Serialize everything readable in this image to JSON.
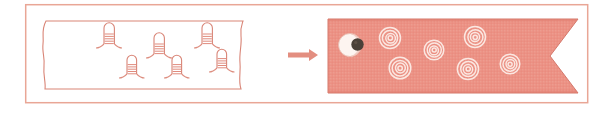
{
  "figure": {
    "title": "Hairpin-studded sheet transforms into ringed ribbon",
    "caption": "",
    "width": 615,
    "height": 113,
    "background_color": "#ffffff"
  },
  "colors": {
    "outline": "#d98577",
    "outline_light": "#e7a496",
    "ribbon_fill": "#ec9184",
    "ribbon_edge": "#d4786b",
    "ribbon_texture": "#e8ad9f",
    "ring_stroke": "#fbe7e1",
    "eye_white": "#fdf4f0",
    "eye_pupil": "#4a4038",
    "eye_iris": "#6b5a4e",
    "arrow": "#e38e80",
    "panel_fill": "#ffffff",
    "border": "#e9a696"
  },
  "outer_border": {
    "label": "figure-frame",
    "x": 25,
    "y": 4,
    "width": 563,
    "height": 99,
    "stroke_width": 1.4
  },
  "left_panel": {
    "label": "membrane-sheet",
    "description": "torn-edge sheet with hairpin stem-loops",
    "x": 42,
    "y": 20,
    "width": 200,
    "height": 70,
    "hairpins": [
      {
        "id": "hairpin-1",
        "row": "top",
        "cx": 108,
        "base_y": 22,
        "height": 22,
        "rungs": 5
      },
      {
        "id": "hairpin-2",
        "row": "top",
        "cx": 158,
        "base_y": 32,
        "height": 22,
        "rungs": 5
      },
      {
        "id": "hairpin-3",
        "row": "top",
        "cx": 206,
        "base_y": 22,
        "height": 22,
        "rungs": 5
      },
      {
        "id": "hairpin-4",
        "row": "bottom",
        "cx": 131,
        "base_y": 73,
        "height": 21,
        "rungs": 5
      },
      {
        "id": "hairpin-5",
        "row": "bottom",
        "cx": 176,
        "base_y": 73,
        "height": 21,
        "rungs": 5
      },
      {
        "id": "hairpin-6",
        "row": "bottom",
        "cx": 221,
        "base_y": 67,
        "height": 21,
        "rungs": 5
      }
    ],
    "hairpin_count": 6
  },
  "arrow": {
    "label": "transformation-arrow",
    "direction": "right",
    "x1": 288,
    "x2": 318,
    "y": 55,
    "shaft_width": 5,
    "head_length": 9,
    "head_width": 13
  },
  "right_panel": {
    "label": "ringed-ribbon",
    "description": "salmon ribbon banner with notched tail and concentric rings",
    "x": 328,
    "y": 19,
    "width": 250,
    "height": 74,
    "notch_depth": 28,
    "eye": {
      "id": "eye-structure",
      "cx": 350,
      "cy": 45,
      "outer_r": 12,
      "pupil_cx": 357,
      "pupil_cy": 44,
      "pupil_r": 6
    },
    "rings": [
      {
        "id": "ring-1",
        "cx": 390,
        "cy": 38,
        "r": 11,
        "turns": 4
      },
      {
        "id": "ring-2",
        "cx": 434,
        "cy": 50,
        "r": 10,
        "turns": 4
      },
      {
        "id": "ring-3",
        "cx": 475,
        "cy": 37,
        "r": 11,
        "turns": 4
      },
      {
        "id": "ring-4",
        "cx": 400,
        "cy": 68,
        "r": 11,
        "turns": 4
      },
      {
        "id": "ring-5",
        "cx": 468,
        "cy": 69,
        "r": 11,
        "turns": 4
      },
      {
        "id": "ring-6",
        "cx": 510,
        "cy": 64,
        "r": 10,
        "turns": 4
      }
    ],
    "ring_count": 6
  }
}
